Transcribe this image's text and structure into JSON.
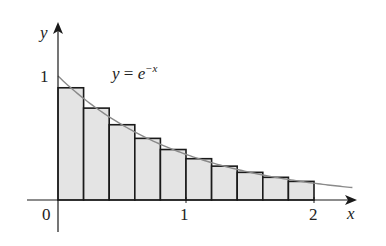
{
  "chart_data": {
    "type": "bar",
    "title": "",
    "function_label": "y = e^{-x}",
    "function_label_parts": {
      "lhs": "y",
      "eq": " = ",
      "base": "e",
      "exponent": "−x"
    },
    "xlabel": "x",
    "ylabel": "y",
    "x_ticks": [
      {
        "value": 0,
        "label": "0"
      },
      {
        "value": 1,
        "label": "1"
      },
      {
        "value": 2,
        "label": "2"
      }
    ],
    "y_ticks": [
      {
        "value": 1,
        "label": "1"
      }
    ],
    "xlim": [
      -0.25,
      2.35
    ],
    "ylim": [
      -0.25,
      1.4
    ],
    "grid": false,
    "n_rectangles": 10,
    "rect_width": 0.2,
    "rule": "midpoint",
    "categories": [
      0.1,
      0.3,
      0.5,
      0.7,
      0.9,
      1.1,
      1.3,
      1.5,
      1.7,
      1.9
    ],
    "values": [
      0.905,
      0.741,
      0.607,
      0.497,
      0.407,
      0.333,
      0.273,
      0.223,
      0.183,
      0.15
    ],
    "curve": {
      "x_start": 0,
      "x_end": 2.3
    }
  },
  "colors": {
    "rect_fill": "#e4e4e4",
    "rect_stroke": "#1a1a1a",
    "curve": "#8a8a8a",
    "axis": "#1a1a1a"
  }
}
